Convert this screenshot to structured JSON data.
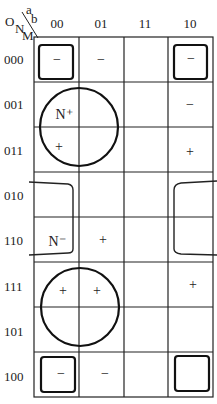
{
  "corner": {
    "col_vars_top": "a",
    "col_vars_bottom": "b",
    "row_vars": [
      "O",
      "N",
      "M"
    ]
  },
  "columns": [
    "00",
    "01",
    "11",
    "10"
  ],
  "rows": [
    "000",
    "001",
    "011",
    "010",
    "110",
    "111",
    "101",
    "100"
  ],
  "cells": [
    [
      "−",
      "−",
      "",
      "−"
    ],
    [
      "N⁺",
      "",
      "",
      "−"
    ],
    [
      "+",
      "",
      "",
      "+"
    ],
    [
      "",
      "",
      "",
      ""
    ],
    [
      "N⁻",
      "+",
      "",
      ""
    ],
    [
      "+",
      "+",
      "",
      "+"
    ],
    [
      "",
      "",
      "",
      ""
    ],
    [
      "−",
      "−",
      "",
      ""
    ]
  ],
  "groups": [
    {
      "name": "corner-square-000-00",
      "shape": "rounded-square"
    },
    {
      "name": "corner-square-000-10",
      "shape": "rounded-square"
    },
    {
      "name": "corner-square-100-00",
      "shape": "rounded-square"
    },
    {
      "name": "corner-square-100-10",
      "shape": "rounded-square"
    },
    {
      "name": "circle-N-plus",
      "shape": "circle"
    },
    {
      "name": "circle-lower",
      "shape": "circle"
    },
    {
      "name": "bracket-left-N-minus",
      "shape": "open-bracket"
    },
    {
      "name": "bracket-right",
      "shape": "open-bracket"
    }
  ],
  "colors": {
    "line": "#222222",
    "background": "#ffffff"
  }
}
